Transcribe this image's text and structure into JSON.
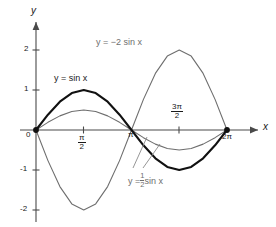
{
  "chart_data": {
    "type": "line",
    "title": "",
    "xlabel": "x",
    "ylabel": "y",
    "xlim": [
      0,
      6.283185307179586
    ],
    "ylim": [
      -2.4,
      2.4
    ],
    "grid": false,
    "legend_position": "inline-annotations",
    "x_ticks": [
      {
        "value": 1.5707963267948966,
        "label": "π/2",
        "numerator": "π",
        "denominator": "2",
        "display": "fraction"
      },
      {
        "value": 3.141592653589793,
        "label": "π",
        "display": "plain"
      },
      {
        "value": 4.71238898038469,
        "label": "3π/2",
        "numerator": "3π",
        "denominator": "2",
        "display": "fraction"
      },
      {
        "value": 6.283185307179586,
        "label": "2π",
        "display": "plain"
      }
    ],
    "y_ticks": [
      {
        "value": 2,
        "label": "2"
      },
      {
        "value": 1,
        "label": "1"
      },
      {
        "value": 0,
        "label": "0"
      },
      {
        "value": -1,
        "label": "-1"
      },
      {
        "value": -2,
        "label": "-2"
      }
    ],
    "origin_label": "0",
    "series": [
      {
        "name": "y = sin x",
        "equation": "y = sin x",
        "amplitude": 1,
        "color": "#111111",
        "width": 2.1,
        "samples_x": [
          0,
          0.3927,
          0.7854,
          1.1781,
          1.5708,
          1.9635,
          2.3562,
          2.7489,
          3.1416,
          3.5343,
          3.927,
          4.3197,
          4.7124,
          5.1051,
          5.4978,
          5.8905,
          6.2832
        ],
        "samples_y": [
          0,
          0.3827,
          0.7071,
          0.9239,
          1,
          0.9239,
          0.7071,
          0.3827,
          0,
          -0.3827,
          -0.7071,
          -0.9239,
          -1,
          -0.9239,
          -0.7071,
          -0.3827,
          0
        ]
      },
      {
        "name": "y = 1/2 sin x",
        "equation": "y = ½ sin x",
        "amplitude": 0.5,
        "color": "#6e6e6e",
        "width": 1.1,
        "samples_x": [
          0,
          0.3927,
          0.7854,
          1.1781,
          1.5708,
          1.9635,
          2.3562,
          2.7489,
          3.1416,
          3.5343,
          3.927,
          4.3197,
          4.7124,
          5.1051,
          5.4978,
          5.8905,
          6.2832
        ],
        "samples_y": [
          0,
          0.1913,
          0.3536,
          0.4619,
          0.5,
          0.4619,
          0.3536,
          0.1913,
          0,
          -0.1913,
          -0.3536,
          -0.4619,
          -0.5,
          -0.4619,
          -0.3536,
          -0.1913,
          0
        ]
      },
      {
        "name": "y = -2 sin x",
        "equation": "y = −2 sin x",
        "amplitude": -2,
        "color": "#6e6e6e",
        "width": 1.1,
        "samples_x": [
          0,
          0.3927,
          0.7854,
          1.1781,
          1.5708,
          1.9635,
          2.3562,
          2.7489,
          3.1416,
          3.5343,
          3.927,
          4.3197,
          4.7124,
          5.1051,
          5.4978,
          5.8905,
          6.2832
        ],
        "samples_y": [
          0,
          -0.7654,
          -1.4142,
          -1.8478,
          -2,
          -1.8478,
          -1.4142,
          -0.7654,
          0,
          0.7654,
          1.4142,
          1.8478,
          2,
          1.8478,
          1.4142,
          0.7654,
          0
        ]
      }
    ],
    "markers": [
      {
        "x": 0,
        "y": 0,
        "style": "filled-dot",
        "color": "#111111"
      },
      {
        "x": 6.283185307179586,
        "y": 0,
        "style": "filled-dot",
        "color": "#111111"
      }
    ],
    "annotations": [
      {
        "id": "sin",
        "text": "y = sin x",
        "color": "#111111",
        "leader": false
      },
      {
        "id": "neg2sin",
        "text": "y = −2 sin x",
        "color": "#6e6e6e",
        "leader": false
      },
      {
        "id": "halfsin",
        "text": "y = ½ sin x",
        "color": "#6e6e6e",
        "leader": true,
        "leader_count": 2
      }
    ]
  },
  "labels": {
    "y_axis": "y",
    "x_axis": "x",
    "origin": "0",
    "y2": "2",
    "y1": "1",
    "ym1": "-1",
    "ym2": "-2",
    "pi": "π",
    "two_pi": "2π",
    "pi_over_2_num": "π",
    "pi_over_2_den": "2",
    "three_pi_over_2_num": "3π",
    "three_pi_over_2_den": "2",
    "eq_sin_lhs": "y = sin x",
    "eq_neg2sin": "y = −2 sin x",
    "eq_half_prefix": "y =",
    "eq_half_num": "1",
    "eq_half_den": "2",
    "eq_half_suffix": "sin x"
  }
}
